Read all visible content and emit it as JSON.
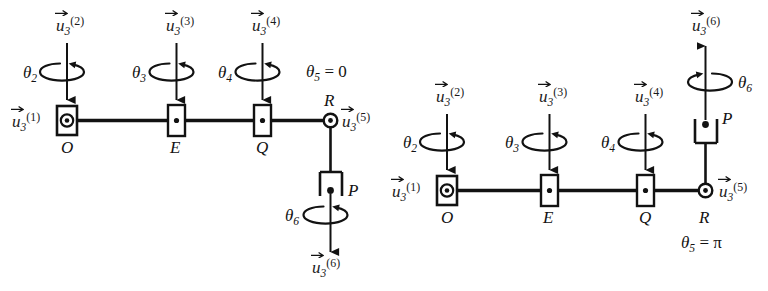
{
  "figure": {
    "background_color": "#ffffff",
    "line_color": "#121212",
    "panels": [
      {
        "id": "left",
        "config_label": "θ5 = 0",
        "config_symbol_base": "θ",
        "config_symbol_sub": "5",
        "config_symbol_rhs": "0",
        "joints": [
          {
            "name": "O",
            "type": "boxed-circle-dot",
            "axis": "vertical-down"
          },
          {
            "name": "E",
            "type": "boxed-dot",
            "axis": "vertical-down"
          },
          {
            "name": "Q",
            "type": "boxed-dot",
            "axis": "vertical-down"
          },
          {
            "name": "R",
            "type": "circle-dot",
            "axis": "out-of-plane"
          },
          {
            "name": "P",
            "type": "u-bracket-open-down",
            "axis": "vertical-down"
          }
        ],
        "axis_vectors": [
          {
            "label_base": "u",
            "sub": "3",
            "sup": "(1)",
            "at": "O",
            "direction": "out-of-plane"
          },
          {
            "label_base": "u",
            "sub": "3",
            "sup": "(2)",
            "at": "O",
            "direction": "down"
          },
          {
            "label_base": "u",
            "sub": "3",
            "sup": "(3)",
            "at": "E",
            "direction": "down"
          },
          {
            "label_base": "u",
            "sub": "3",
            "sup": "(4)",
            "at": "Q",
            "direction": "down"
          },
          {
            "label_base": "u",
            "sub": "3",
            "sup": "(5)",
            "at": "R",
            "direction": "out-of-plane"
          },
          {
            "label_base": "u",
            "sub": "3",
            "sup": "(6)",
            "at": "P",
            "direction": "down"
          }
        ],
        "rotations": [
          {
            "label_base": "θ",
            "sub": "2",
            "about": "O"
          },
          {
            "label_base": "θ",
            "sub": "3",
            "about": "E"
          },
          {
            "label_base": "θ",
            "sub": "4",
            "about": "Q"
          },
          {
            "label_base": "θ",
            "sub": "6",
            "about": "P"
          }
        ]
      },
      {
        "id": "right",
        "config_label": "θ5 = π",
        "config_symbol_base": "θ",
        "config_symbol_sub": "5",
        "config_symbol_rhs": "π",
        "joints": [
          {
            "name": "O",
            "type": "boxed-circle-dot",
            "axis": "vertical-down"
          },
          {
            "name": "E",
            "type": "boxed-dot",
            "axis": "vertical-down"
          },
          {
            "name": "Q",
            "type": "boxed-dot",
            "axis": "vertical-down"
          },
          {
            "name": "R",
            "type": "circle-dot",
            "axis": "out-of-plane"
          },
          {
            "name": "P",
            "type": "u-bracket-open-up",
            "axis": "vertical-up"
          }
        ],
        "axis_vectors": [
          {
            "label_base": "u",
            "sub": "3",
            "sup": "(1)",
            "at": "O",
            "direction": "out-of-plane"
          },
          {
            "label_base": "u",
            "sub": "3",
            "sup": "(2)",
            "at": "O",
            "direction": "down"
          },
          {
            "label_base": "u",
            "sub": "3",
            "sup": "(3)",
            "at": "E",
            "direction": "down"
          },
          {
            "label_base": "u",
            "sub": "3",
            "sup": "(4)",
            "at": "Q",
            "direction": "down"
          },
          {
            "label_base": "u",
            "sub": "3",
            "sup": "(5)",
            "at": "R",
            "direction": "out-of-plane"
          },
          {
            "label_base": "u",
            "sub": "3",
            "sup": "(6)",
            "at": "P",
            "direction": "up"
          }
        ],
        "rotations": [
          {
            "label_base": "θ",
            "sub": "2",
            "about": "O"
          },
          {
            "label_base": "θ",
            "sub": "3",
            "about": "E"
          },
          {
            "label_base": "θ",
            "sub": "4",
            "about": "Q"
          },
          {
            "label_base": "θ",
            "sub": "6",
            "about": "P"
          }
        ]
      }
    ]
  },
  "left": {
    "points": {
      "O": "O",
      "E": "E",
      "Q": "Q",
      "R": "R",
      "P": "P"
    },
    "thetas": {
      "t2_base": "θ",
      "t2_sub": "2",
      "t3_base": "θ",
      "t3_sub": "3",
      "t4_base": "θ",
      "t4_sub": "4",
      "t6_base": "θ",
      "t6_sub": "6"
    },
    "config": {
      "base": "θ",
      "sub": "5",
      "eq": " = 0"
    },
    "vectors": {
      "u1": {
        "base": "u",
        "sub": "3",
        "sup": "(1)"
      },
      "u2": {
        "base": "u",
        "sub": "3",
        "sup": "(2)"
      },
      "u3": {
        "base": "u",
        "sub": "3",
        "sup": "(3)"
      },
      "u4": {
        "base": "u",
        "sub": "3",
        "sup": "(4)"
      },
      "u5": {
        "base": "u",
        "sub": "3",
        "sup": "(5)"
      },
      "u6": {
        "base": "u",
        "sub": "3",
        "sup": "(6)"
      }
    }
  },
  "right": {
    "points": {
      "O": "O",
      "E": "E",
      "Q": "Q",
      "R": "R",
      "P": "P"
    },
    "thetas": {
      "t2_base": "θ",
      "t2_sub": "2",
      "t3_base": "θ",
      "t3_sub": "3",
      "t4_base": "θ",
      "t4_sub": "4",
      "t6_base": "θ",
      "t6_sub": "6"
    },
    "config": {
      "base": "θ",
      "sub": "5",
      "eq": " = π"
    },
    "vectors": {
      "u1": {
        "base": "u",
        "sub": "3",
        "sup": "(1)"
      },
      "u2": {
        "base": "u",
        "sub": "3",
        "sup": "(2)"
      },
      "u3": {
        "base": "u",
        "sub": "3",
        "sup": "(3)"
      },
      "u4": {
        "base": "u",
        "sub": "3",
        "sup": "(4)"
      },
      "u5": {
        "base": "u",
        "sub": "3",
        "sup": "(5)"
      },
      "u6": {
        "base": "u",
        "sub": "3",
        "sup": "(6)"
      }
    }
  }
}
